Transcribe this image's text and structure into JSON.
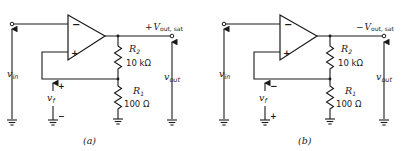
{
  "figure": {
    "panels": [
      {
        "id": "a",
        "caption": "(a)",
        "output_label_sign": "+",
        "output_label_main": "V",
        "output_label_sub": "out, sat",
        "opamp": {
          "inverting_sign": "−",
          "noninverting_sign": "+"
        },
        "r2": {
          "name": "R",
          "sub": "2",
          "value": "10 kΩ"
        },
        "r1": {
          "name": "R",
          "sub": "1",
          "value": "100 Ω"
        },
        "vin": {
          "main": "v",
          "sub": "in"
        },
        "vout": {
          "main": "v",
          "sub": "out"
        },
        "vf": {
          "main": "v",
          "sub": "f",
          "top_sign": "+",
          "bottom_sign": "−"
        }
      },
      {
        "id": "b",
        "caption": "(b)",
        "output_label_sign": "−",
        "output_label_main": "V",
        "output_label_sub": "out, sat",
        "opamp": {
          "inverting_sign": "−",
          "noninverting_sign": "+"
        },
        "r2": {
          "name": "R",
          "sub": "2",
          "value": "10 kΩ"
        },
        "r1": {
          "name": "R",
          "sub": "1",
          "value": "100 Ω"
        },
        "vin": {
          "main": "v",
          "sub": "in"
        },
        "vout": {
          "main": "v",
          "sub": "out"
        },
        "vf": {
          "main": "v",
          "sub": "f",
          "top_sign": "−",
          "bottom_sign": "+"
        }
      }
    ]
  }
}
